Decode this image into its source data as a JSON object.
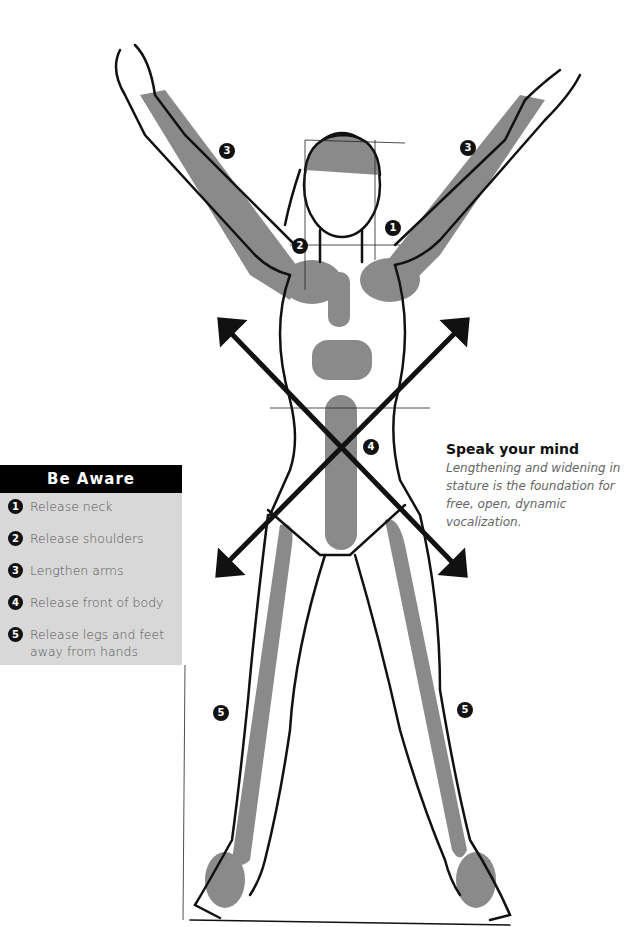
{
  "be_aware": {
    "title": "Be Aware",
    "items": [
      {
        "num": "1",
        "label": "Release neck"
      },
      {
        "num": "2",
        "label": "Release shoulders"
      },
      {
        "num": "3",
        "label": "Lengthen arms"
      },
      {
        "num": "4",
        "label": "Release front of body"
      },
      {
        "num": "5",
        "label": "Release legs and feet away from hands"
      }
    ]
  },
  "speak_your_mind": {
    "title": "Speak your mind",
    "body": "Lengthening and widening in stature is the foundation for free, open, dynamic vocalization."
  },
  "markers": {
    "neck": "1",
    "shoulders": "2",
    "arm_left": "3",
    "arm_right": "3",
    "front_body": "4",
    "leg_left": "5",
    "leg_right": "5"
  },
  "colors": {
    "shade": "#8a8a8a",
    "line": "#111111",
    "panel_bg": "#d8d8d8",
    "panel_header": "#000000"
  }
}
